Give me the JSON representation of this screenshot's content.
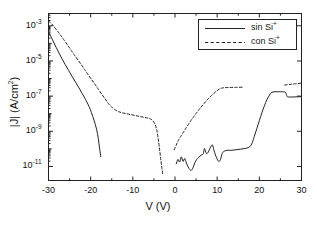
{
  "chart_data": {
    "type": "line",
    "title": "",
    "xlabel": "V (V)",
    "ylabel": "|J| (A/cm²)",
    "xlim": [
      -30,
      30
    ],
    "ylim_log10": [
      -11.8,
      -2.3
    ],
    "xticks": [
      "-30",
      "-20",
      "-10",
      "0",
      "10",
      "20",
      "30"
    ],
    "xtick_values": [
      -30,
      -20,
      -10,
      0,
      10,
      20,
      30
    ],
    "yticks": [
      "10-3",
      "10-5",
      "10-7",
      "10-9",
      "10-11"
    ],
    "ytick_log10": [
      -3,
      -5,
      -7,
      -9,
      -11
    ],
    "ytick_mantissa": "10",
    "ytick_exponents": [
      "-3",
      "-5",
      "-7",
      "-9",
      "-11"
    ],
    "grid": false,
    "legend_position": "top-right",
    "series": [
      {
        "name": "sin Si+",
        "label_main": "sin Si",
        "label_sup": "+",
        "style": "solid",
        "color": "#222222",
        "points": [
          [
            -30.0,
            -3.35
          ],
          [
            -29.4,
            -3.62
          ],
          [
            -28.8,
            -3.92
          ],
          [
            -28.2,
            -4.22
          ],
          [
            -27.5,
            -4.55
          ],
          [
            -26.8,
            -4.88
          ],
          [
            -26.0,
            -5.22
          ],
          [
            -25.2,
            -5.55
          ],
          [
            -24.4,
            -5.88
          ],
          [
            -23.6,
            -6.2
          ],
          [
            -22.8,
            -6.52
          ],
          [
            -22.0,
            -6.85
          ],
          [
            -21.2,
            -7.2
          ],
          [
            -20.4,
            -7.58
          ],
          [
            -19.8,
            -7.95
          ],
          [
            -19.2,
            -8.38
          ],
          [
            -18.6,
            -8.88
          ],
          [
            -18.2,
            -9.4
          ],
          [
            -17.9,
            -9.95
          ],
          [
            -17.6,
            -10.45
          ]
        ]
      },
      {
        "name": "sin Si+ (positive branch)",
        "label_main": "sin Si",
        "label_sup": "+",
        "style": "solid",
        "color": "#222222",
        "points": [
          [
            0.3,
            -10.85
          ],
          [
            0.7,
            -10.6
          ],
          [
            1.1,
            -10.75
          ],
          [
            1.5,
            -10.45
          ],
          [
            1.9,
            -10.72
          ],
          [
            2.3,
            -10.55
          ],
          [
            2.7,
            -10.8
          ],
          [
            3.1,
            -11.02
          ],
          [
            3.5,
            -11.18
          ],
          [
            3.9,
            -11.22
          ],
          [
            4.3,
            -11.05
          ],
          [
            4.7,
            -10.8
          ],
          [
            5.1,
            -10.62
          ],
          [
            5.5,
            -10.5
          ],
          [
            5.9,
            -10.42
          ],
          [
            6.3,
            -10.35
          ],
          [
            6.7,
            -10.28
          ],
          [
            7.0,
            -9.98
          ],
          [
            7.4,
            -10.25
          ],
          [
            7.8,
            -10.22
          ],
          [
            8.2,
            -10.02
          ],
          [
            8.6,
            -9.82
          ],
          [
            8.9,
            -9.78
          ],
          [
            9.2,
            -10.05
          ],
          [
            9.6,
            -10.35
          ],
          [
            10.0,
            -10.58
          ],
          [
            10.4,
            -10.72
          ],
          [
            10.8,
            -10.6
          ],
          [
            11.2,
            -10.25
          ],
          [
            11.8,
            -10.12
          ],
          [
            12.5,
            -10.08
          ],
          [
            13.5,
            -10.08
          ],
          [
            14.5,
            -10.05
          ],
          [
            15.5,
            -10.02
          ],
          [
            16.5,
            -9.98
          ],
          [
            17.5,
            -9.92
          ],
          [
            18.2,
            -9.72
          ],
          [
            18.8,
            -9.3
          ],
          [
            19.4,
            -8.85
          ],
          [
            20.0,
            -8.4
          ],
          [
            20.6,
            -7.95
          ],
          [
            21.2,
            -7.55
          ],
          [
            21.8,
            -7.2
          ],
          [
            22.4,
            -6.95
          ],
          [
            23.0,
            -6.78
          ],
          [
            24.0,
            -6.75
          ],
          [
            25.0,
            -6.75
          ],
          [
            25.8,
            -6.76
          ],
          [
            26.2,
            -6.78
          ],
          [
            26.6,
            -7.02
          ],
          [
            27.0,
            -7.05
          ],
          [
            28.0,
            -7.05
          ],
          [
            29.0,
            -7.04
          ],
          [
            30.0,
            -7.03
          ]
        ]
      },
      {
        "name": "con Si+",
        "label_main": "con Si",
        "label_sup": "+",
        "style": "dashed",
        "color": "#222222",
        "points": [
          [
            -30.0,
            -2.72
          ],
          [
            -29.3,
            -2.88
          ],
          [
            -28.6,
            -3.08
          ],
          [
            -27.8,
            -3.32
          ],
          [
            -27.0,
            -3.58
          ],
          [
            -26.2,
            -3.85
          ],
          [
            -25.4,
            -4.12
          ],
          [
            -24.6,
            -4.4
          ],
          [
            -23.8,
            -4.68
          ],
          [
            -23.0,
            -4.95
          ],
          [
            -22.2,
            -5.22
          ],
          [
            -21.4,
            -5.5
          ],
          [
            -20.6,
            -5.78
          ],
          [
            -19.8,
            -6.05
          ],
          [
            -19.0,
            -6.32
          ],
          [
            -18.2,
            -6.6
          ],
          [
            -17.4,
            -6.88
          ],
          [
            -16.6,
            -7.15
          ],
          [
            -15.8,
            -7.42
          ],
          [
            -15.0,
            -7.62
          ],
          [
            -14.2,
            -7.78
          ],
          [
            -13.4,
            -7.88
          ],
          [
            -12.5,
            -7.95
          ],
          [
            -11.5,
            -8.0
          ],
          [
            -10.5,
            -8.05
          ],
          [
            -9.5,
            -8.1
          ],
          [
            -8.5,
            -8.15
          ],
          [
            -7.5,
            -8.2
          ],
          [
            -6.5,
            -8.25
          ],
          [
            -5.8,
            -8.3
          ],
          [
            -5.2,
            -8.42
          ],
          [
            -4.7,
            -8.62
          ],
          [
            -4.3,
            -8.95
          ],
          [
            -4.0,
            -9.4
          ],
          [
            -3.7,
            -9.95
          ],
          [
            -3.4,
            -10.55
          ],
          [
            -3.1,
            -11.1
          ],
          [
            -2.9,
            -11.45
          ],
          [
            -0.2,
            -10.05
          ],
          [
            0.3,
            -9.78
          ],
          [
            0.8,
            -9.52
          ],
          [
            1.4,
            -9.28
          ],
          [
            2.0,
            -9.05
          ],
          [
            2.6,
            -8.82
          ],
          [
            3.2,
            -8.6
          ],
          [
            3.8,
            -8.38
          ],
          [
            4.4,
            -8.18
          ],
          [
            5.0,
            -7.98
          ],
          [
            5.6,
            -7.8
          ],
          [
            6.2,
            -7.62
          ],
          [
            6.8,
            -7.45
          ],
          [
            7.4,
            -7.28
          ],
          [
            8.0,
            -7.12
          ],
          [
            8.6,
            -6.98
          ],
          [
            9.2,
            -6.85
          ],
          [
            9.8,
            -6.72
          ],
          [
            10.4,
            -6.62
          ],
          [
            11.0,
            -6.55
          ],
          [
            11.8,
            -6.52
          ],
          [
            13.0,
            -6.51
          ],
          [
            14.5,
            -6.5
          ],
          [
            16.0,
            -6.49
          ],
          [
            18.0,
            -6.48
          ],
          [
            20.0,
            -6.46
          ],
          [
            22.0,
            -6.44
          ],
          [
            24.0,
            -6.41
          ],
          [
            26.0,
            -6.37
          ],
          [
            27.5,
            -6.33
          ],
          [
            28.5,
            -6.3
          ],
          [
            30.0,
            -6.26
          ]
        ]
      }
    ]
  },
  "axes": {
    "x_title": "V (V)",
    "y_title": "|J| (A/cm²)",
    "y_title_main": "|J| (A/cm",
    "y_title_sup": "2",
    "y_title_tail": ")"
  },
  "legend": {
    "entries": [
      {
        "label_main": "sin Si",
        "label_sup": "+",
        "style": "solid"
      },
      {
        "label_main": "con Si",
        "label_sup": "+",
        "style": "dashed"
      }
    ]
  },
  "colors": {
    "axis": "#222222",
    "curve": "#222222",
    "background": "#ffffff"
  }
}
